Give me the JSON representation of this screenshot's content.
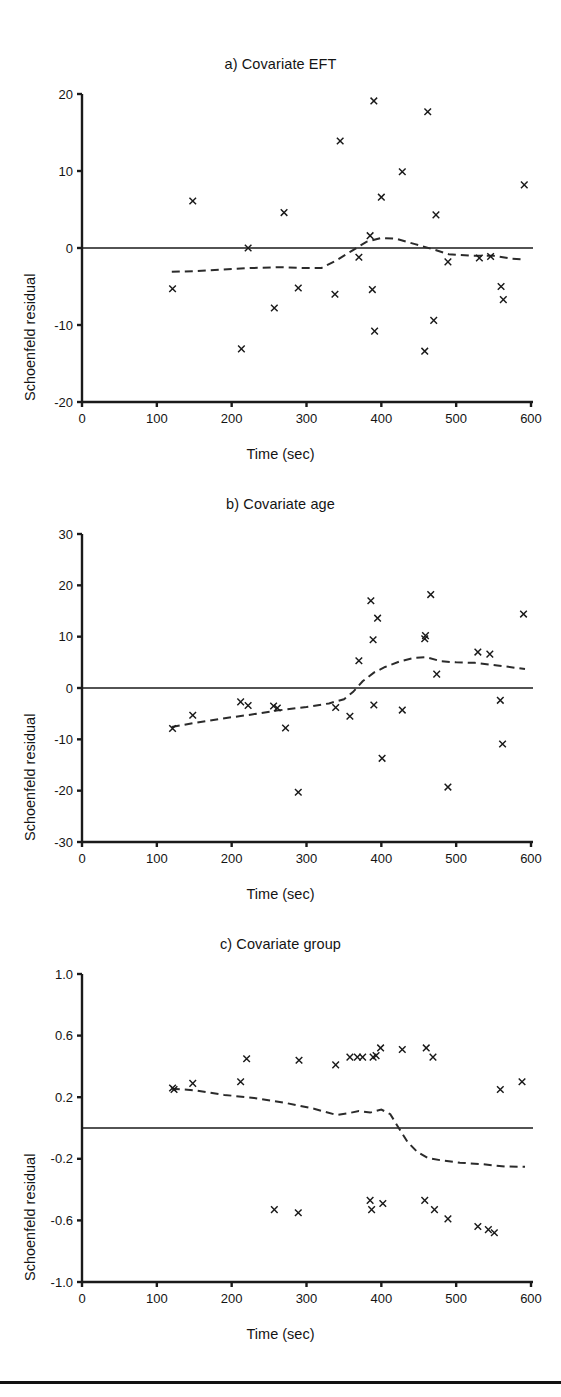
{
  "figure": {
    "background_color": "#ffffff",
    "ink_color": "#1a1a1a",
    "bottom_rule_color": "#121212",
    "panel_count": 3
  },
  "axis_common": {
    "xlabel": "Time (sec)",
    "ylabel": "Schoenfeld residual",
    "xlim": [
      0,
      600
    ],
    "xticks": [
      0,
      100,
      200,
      300,
      400,
      500,
      600
    ],
    "xtick_labels": [
      "0",
      "100",
      "200",
      "300",
      "400",
      "500",
      "600"
    ],
    "grid": false,
    "legend": "none",
    "marker": "x-cross",
    "smoother_style": "dashed",
    "reference_line": 0
  },
  "chart_data": [
    {
      "id": "panel-a",
      "type": "scatter",
      "title": "a) Covariate EFT",
      "xlabel": "Time (sec)",
      "ylabel": "Schoenfeld residual",
      "xlim": [
        0,
        600
      ],
      "ylim": [
        -20,
        20
      ],
      "yticks": [
        20,
        10,
        0,
        -10,
        -20
      ],
      "ytick_labels": [
        "20",
        "10",
        "0",
        "-10",
        "-20"
      ],
      "xticks": [
        0,
        100,
        200,
        300,
        400,
        500,
        600
      ],
      "xtick_labels": [
        "0",
        "100",
        "200",
        "300",
        "400",
        "500",
        "600"
      ],
      "grid": false,
      "legend": "none",
      "reference_line_y": 0,
      "points": [
        {
          "x": 121,
          "y": -5.3
        },
        {
          "x": 148,
          "y": 6.1
        },
        {
          "x": 213,
          "y": -13.1
        },
        {
          "x": 222,
          "y": 0.0
        },
        {
          "x": 257,
          "y": -7.8
        },
        {
          "x": 270,
          "y": 4.6
        },
        {
          "x": 289,
          "y": -5.2
        },
        {
          "x": 338,
          "y": -6.0
        },
        {
          "x": 345,
          "y": 13.9
        },
        {
          "x": 370,
          "y": -1.2
        },
        {
          "x": 385,
          "y": 1.6
        },
        {
          "x": 388,
          "y": -5.4
        },
        {
          "x": 390,
          "y": 19.1
        },
        {
          "x": 391,
          "y": -10.8
        },
        {
          "x": 400,
          "y": 6.6
        },
        {
          "x": 428,
          "y": 9.9
        },
        {
          "x": 458,
          "y": -13.4
        },
        {
          "x": 462,
          "y": 17.7
        },
        {
          "x": 470,
          "y": -9.4
        },
        {
          "x": 473,
          "y": 4.3
        },
        {
          "x": 489,
          "y": -1.8
        },
        {
          "x": 531,
          "y": -1.3
        },
        {
          "x": 546,
          "y": -1.1
        },
        {
          "x": 560,
          "y": -5.0
        },
        {
          "x": 563,
          "y": -6.7
        },
        {
          "x": 591,
          "y": 8.2
        }
      ],
      "smoother": [
        {
          "x": 120,
          "y": -3.1
        },
        {
          "x": 150,
          "y": -3.0
        },
        {
          "x": 185,
          "y": -2.8
        },
        {
          "x": 225,
          "y": -2.6
        },
        {
          "x": 265,
          "y": -2.5
        },
        {
          "x": 300,
          "y": -2.6
        },
        {
          "x": 320,
          "y": -2.6
        },
        {
          "x": 340,
          "y": -1.6
        },
        {
          "x": 360,
          "y": -0.4
        },
        {
          "x": 380,
          "y": 0.8
        },
        {
          "x": 400,
          "y": 1.3
        },
        {
          "x": 420,
          "y": 1.2
        },
        {
          "x": 445,
          "y": 0.5
        },
        {
          "x": 470,
          "y": -0.2
        },
        {
          "x": 490,
          "y": -0.8
        },
        {
          "x": 520,
          "y": -1.0
        },
        {
          "x": 550,
          "y": -1.0
        },
        {
          "x": 575,
          "y": -1.4
        },
        {
          "x": 592,
          "y": -1.5
        }
      ]
    },
    {
      "id": "panel-b",
      "type": "scatter",
      "title": "b) Covariate age",
      "xlabel": "Time (sec)",
      "ylabel": "Schoenfeld residual",
      "xlim": [
        0,
        600
      ],
      "ylim": [
        -30,
        30
      ],
      "yticks": [
        30,
        20,
        10,
        0,
        -10,
        -20,
        -30
      ],
      "ytick_labels": [
        "30",
        "20",
        "10",
        "0",
        "-10",
        "-20",
        "-30"
      ],
      "xticks": [
        0,
        100,
        200,
        300,
        400,
        500,
        600
      ],
      "xtick_labels": [
        "0",
        "100",
        "200",
        "300",
        "400",
        "500",
        "600"
      ],
      "grid": false,
      "legend": "none",
      "reference_line_y": 0,
      "points": [
        {
          "x": 121,
          "y": -7.9
        },
        {
          "x": 148,
          "y": -5.3
        },
        {
          "x": 212,
          "y": -2.7
        },
        {
          "x": 222,
          "y": -3.4
        },
        {
          "x": 256,
          "y": -3.5
        },
        {
          "x": 261,
          "y": -3.9
        },
        {
          "x": 272,
          "y": -7.8
        },
        {
          "x": 289,
          "y": -20.3
        },
        {
          "x": 339,
          "y": -3.8
        },
        {
          "x": 358,
          "y": -5.5
        },
        {
          "x": 370,
          "y": 5.3
        },
        {
          "x": 386,
          "y": 17.0
        },
        {
          "x": 389,
          "y": 9.4
        },
        {
          "x": 390,
          "y": -3.3
        },
        {
          "x": 395,
          "y": 13.6
        },
        {
          "x": 401,
          "y": -13.7
        },
        {
          "x": 428,
          "y": -4.3
        },
        {
          "x": 458,
          "y": 9.6
        },
        {
          "x": 459,
          "y": 10.2
        },
        {
          "x": 466,
          "y": 18.2
        },
        {
          "x": 474,
          "y": 2.7
        },
        {
          "x": 489,
          "y": -19.3
        },
        {
          "x": 529,
          "y": 7.0
        },
        {
          "x": 545,
          "y": 6.6
        },
        {
          "x": 559,
          "y": -2.4
        },
        {
          "x": 562,
          "y": -10.9
        },
        {
          "x": 590,
          "y": 14.4
        }
      ],
      "smoother": [
        {
          "x": 120,
          "y": -7.6
        },
        {
          "x": 150,
          "y": -6.8
        },
        {
          "x": 185,
          "y": -6.0
        },
        {
          "x": 225,
          "y": -5.2
        },
        {
          "x": 260,
          "y": -4.4
        },
        {
          "x": 300,
          "y": -3.7
        },
        {
          "x": 330,
          "y": -3.0
        },
        {
          "x": 350,
          "y": -2.2
        },
        {
          "x": 362,
          "y": -0.8
        },
        {
          "x": 375,
          "y": 1.3
        },
        {
          "x": 390,
          "y": 3.0
        },
        {
          "x": 405,
          "y": 4.1
        },
        {
          "x": 425,
          "y": 5.2
        },
        {
          "x": 445,
          "y": 5.9
        },
        {
          "x": 460,
          "y": 6.0
        },
        {
          "x": 480,
          "y": 5.2
        },
        {
          "x": 500,
          "y": 5.0
        },
        {
          "x": 525,
          "y": 4.9
        },
        {
          "x": 555,
          "y": 4.4
        },
        {
          "x": 592,
          "y": 3.7
        }
      ]
    },
    {
      "id": "panel-c",
      "type": "scatter",
      "title": "c) Covariate group",
      "xlabel": "Time (sec)",
      "ylabel": "Schoenfeld residual",
      "xlim": [
        0,
        600
      ],
      "ylim": [
        -1.0,
        1.0
      ],
      "yticks": [
        1.0,
        0.6,
        0.2,
        -0.2,
        -0.6,
        -1.0
      ],
      "ytick_labels": [
        "1.0",
        "0.6",
        "0.2",
        "-0.2",
        "-0.6",
        "-1.0"
      ],
      "xticks": [
        0,
        100,
        200,
        300,
        400,
        500,
        600
      ],
      "xtick_labels": [
        "0",
        "100",
        "200",
        "300",
        "400",
        "500",
        "600"
      ],
      "grid": false,
      "legend": "none",
      "reference_line_y": 0,
      "points": [
        {
          "x": 121,
          "y": 0.26
        },
        {
          "x": 123,
          "y": 0.25
        },
        {
          "x": 148,
          "y": 0.29
        },
        {
          "x": 212,
          "y": 0.3
        },
        {
          "x": 220,
          "y": 0.45
        },
        {
          "x": 257,
          "y": -0.53
        },
        {
          "x": 289,
          "y": -0.55
        },
        {
          "x": 290,
          "y": 0.44
        },
        {
          "x": 339,
          "y": 0.41
        },
        {
          "x": 358,
          "y": 0.46
        },
        {
          "x": 368,
          "y": 0.46
        },
        {
          "x": 375,
          "y": 0.46
        },
        {
          "x": 385,
          "y": -0.47
        },
        {
          "x": 387,
          "y": -0.53
        },
        {
          "x": 389,
          "y": 0.46
        },
        {
          "x": 393,
          "y": 0.47
        },
        {
          "x": 399,
          "y": 0.52
        },
        {
          "x": 402,
          "y": -0.49
        },
        {
          "x": 428,
          "y": 0.51
        },
        {
          "x": 458,
          "y": -0.47
        },
        {
          "x": 460,
          "y": 0.52
        },
        {
          "x": 469,
          "y": 0.46
        },
        {
          "x": 471,
          "y": -0.53
        },
        {
          "x": 489,
          "y": -0.59
        },
        {
          "x": 529,
          "y": -0.64
        },
        {
          "x": 543,
          "y": -0.66
        },
        {
          "x": 551,
          "y": -0.68
        },
        {
          "x": 559,
          "y": 0.25
        },
        {
          "x": 588,
          "y": 0.3
        }
      ],
      "smoother": [
        {
          "x": 120,
          "y": 0.255
        },
        {
          "x": 150,
          "y": 0.245
        },
        {
          "x": 190,
          "y": 0.215
        },
        {
          "x": 230,
          "y": 0.195
        },
        {
          "x": 270,
          "y": 0.165
        },
        {
          "x": 310,
          "y": 0.125
        },
        {
          "x": 340,
          "y": 0.085
        },
        {
          "x": 355,
          "y": 0.095
        },
        {
          "x": 370,
          "y": 0.11
        },
        {
          "x": 385,
          "y": 0.1
        },
        {
          "x": 400,
          "y": 0.12
        },
        {
          "x": 412,
          "y": 0.09
        },
        {
          "x": 422,
          "y": 0.01
        },
        {
          "x": 435,
          "y": -0.09
        },
        {
          "x": 448,
          "y": -0.155
        },
        {
          "x": 462,
          "y": -0.195
        },
        {
          "x": 480,
          "y": -0.21
        },
        {
          "x": 505,
          "y": -0.225
        },
        {
          "x": 535,
          "y": -0.235
        },
        {
          "x": 565,
          "y": -0.25
        },
        {
          "x": 592,
          "y": -0.252
        }
      ]
    }
  ]
}
